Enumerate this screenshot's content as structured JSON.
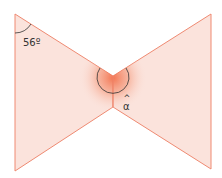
{
  "diagram": {
    "type": "bowtie-geometry",
    "colors": {
      "fill": "#fbe3dc",
      "stroke": "#ef8a72",
      "glow": "#f47a55",
      "arc": "#333333",
      "text": "#333333"
    },
    "labels": {
      "given_angle": "56º",
      "unknown_angle": "α",
      "hat": "^"
    }
  }
}
